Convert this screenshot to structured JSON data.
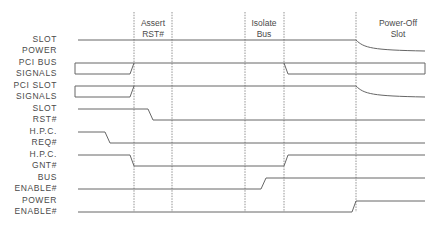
{
  "phases": [
    {
      "id": "assert-rst",
      "label": "Assert\nRST#",
      "x": 153,
      "y": 18
    },
    {
      "id": "isolate-bus",
      "label": "Isolate\nBus",
      "x": 264,
      "y": 18
    },
    {
      "id": "power-off-slot",
      "label": "Power-Off\nSlot",
      "x": 398,
      "y": 18
    }
  ],
  "markers": [
    134,
    172,
    245,
    284,
    356
  ],
  "marker_span": [
    12,
    212
  ],
  "signals": [
    {
      "id": "slot-power",
      "label": "SLOT\nPOWER",
      "label_right": 57,
      "label_top": 34,
      "path": "M78 40 L356 40 C364 48 372 50 425 51"
    },
    {
      "id": "pci-bus-signals",
      "label": "PCI BUS\nSIGNALS",
      "label_right": 57,
      "label_top": 57,
      "path": "M75 63 L75 74 L130 74 L134 63 M75 63 L425 63 M284 63 L288 74 L425 74 L425 63"
    },
    {
      "id": "pci-slot-signals",
      "label": "PCI SLOT\nSIGNALS",
      "label_right": 57,
      "label_top": 80,
      "path": "M75 86 L75 97 L130 97 L134 86 M75 86 L356 86 C364 94 372 96 425 97"
    },
    {
      "id": "slot-rst",
      "label": "SLOT\nRST#",
      "label_right": 57,
      "label_top": 103,
      "path": "M78 109 L148 109 L153 120 L425 120"
    },
    {
      "id": "hpc-req",
      "label": "H.P.C.\nREQ#",
      "label_right": 57,
      "label_top": 126,
      "path": "M78 132 L105 132 L110 143 L425 143"
    },
    {
      "id": "hpc-gnt",
      "label": "H.P.C.\nGNT#",
      "label_right": 57,
      "label_top": 149,
      "path": "M78 155 L130 155 L134 166 L284 166 L288 155 L425 155"
    },
    {
      "id": "bus-enable",
      "label": "BUS\nENABLE#",
      "label_right": 57,
      "label_top": 172,
      "path": "M78 189 L261 189 L266 178 L425 178"
    },
    {
      "id": "power-enable",
      "label": "POWER\nENABLE#",
      "label_right": 57,
      "label_top": 195,
      "path": "M78 212 L352 212 L356 201 L425 201"
    }
  ],
  "colors": {
    "line": "#666666",
    "marker": "#777777",
    "text": "#4a4a4a",
    "background": "#ffffff"
  }
}
